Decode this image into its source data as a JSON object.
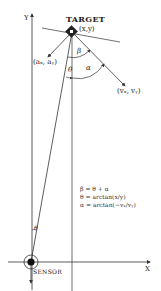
{
  "diagram": {
    "axes": {
      "x_label": "X",
      "y_label": "Y"
    },
    "nodes": {
      "target": {
        "title": "TARGET",
        "coord": "(x,y)"
      },
      "sensor": {
        "title": "SENSOR"
      },
      "acceleration": {
        "label": "(aₓ, aᵧ)"
      },
      "velocity": {
        "label": "(vₓ, vᵧ)"
      }
    },
    "angles": {
      "beta": "β",
      "alpha": "α",
      "theta_top": "θ",
      "theta_bottom": "θ"
    },
    "equations": [
      "β  =  θ + α",
      "θ  =  arctan(x/y)",
      "α  =  arctan(−vₓ/vᵧ)"
    ],
    "colors": {
      "line": "#333333",
      "background": "#ffffff"
    }
  }
}
